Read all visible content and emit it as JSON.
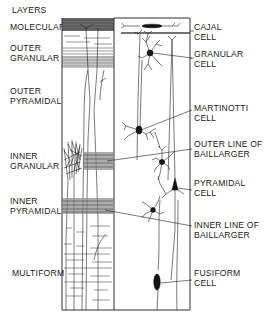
{
  "figure": {
    "title": "LAYERS",
    "layers": [
      {
        "id": "molecular",
        "lines": [
          "MOLECULAR"
        ]
      },
      {
        "id": "outer-granular",
        "lines": [
          "OUTER",
          "GRANULAR"
        ]
      },
      {
        "id": "outer-pyramidal",
        "lines": [
          "OUTER",
          "PYRAMIDAL"
        ]
      },
      {
        "id": "inner-granular",
        "lines": [
          "INNER",
          "GRANULAR"
        ]
      },
      {
        "id": "inner-pyramidal",
        "lines": [
          "INNER",
          "PYRAMIDAL"
        ]
      },
      {
        "id": "multiform",
        "lines": [
          "MULTIFORM"
        ]
      }
    ],
    "cells": [
      {
        "id": "cajal",
        "lines": [
          "CAJAL",
          "CELL"
        ]
      },
      {
        "id": "granular",
        "lines": [
          "GRANULAR",
          "CELL"
        ]
      },
      {
        "id": "martinotti",
        "lines": [
          "MARTINOTTI",
          "CELL"
        ]
      },
      {
        "id": "outer-baillarger",
        "lines": [
          "OUTER LINE OF",
          "BAILLARGER"
        ]
      },
      {
        "id": "pyramidal",
        "lines": [
          "PYRAMIDAL",
          "CELL"
        ]
      },
      {
        "id": "inner-baillarger",
        "lines": [
          "INNER LINE OF",
          "BAILLARGER"
        ]
      },
      {
        "id": "fusiform",
        "lines": [
          "FUSIFORM",
          "CELL"
        ]
      }
    ],
    "colors": {
      "ink": "#1a1a1a",
      "paper": "#ffffff",
      "band": "#8a8a8a"
    }
  }
}
